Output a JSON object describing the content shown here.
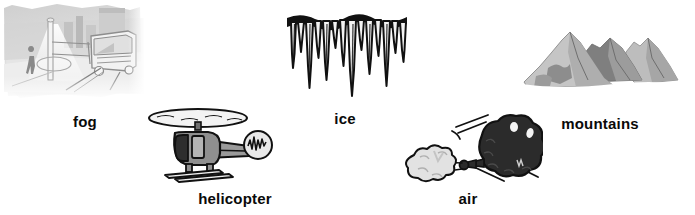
{
  "page": {
    "background_color": "#ffffff",
    "text_color": "#0a0a0a",
    "width": 695,
    "height": 215
  },
  "palette": {
    "ink": "#111111",
    "dark_gray": "#4a4a4a",
    "mid_gray": "#808080",
    "light_gray": "#b8b8b8",
    "pale_gray": "#dcdcdc",
    "near_white": "#f0f0f0",
    "balloon_black": "#2b2b2b"
  },
  "items": [
    {
      "id": "fog",
      "label": "fog",
      "icon": "fog-street-scene-icon",
      "description": "grayscale sketch of a foggy street with a bus, a pedestrian, a lamp post and city buildings",
      "x": 2,
      "y": 2,
      "width": 143,
      "height": 100,
      "label_x": 85,
      "label_y": 113
    },
    {
      "id": "helicopter",
      "label": "helicopter",
      "icon": "helicopter-icon",
      "description": "gray cartoon helicopter with spinning rotor, skids and a noise burst at the tail rotor",
      "x": 145,
      "y": 100,
      "width": 130,
      "height": 85,
      "label_x": 235,
      "label_y": 190
    },
    {
      "id": "ice",
      "label": "ice",
      "icon": "icicles-icon",
      "description": "row of black outlined icicles hanging from a ledge",
      "x": 283,
      "y": 8,
      "width": 128,
      "height": 92,
      "label_x": 345,
      "label_y": 110
    },
    {
      "id": "air",
      "label": "air",
      "icon": "air-balloon-blowing-icon",
      "description": "dark lumpy balloon deflating and blowing a pale puff of air through a nozzle",
      "x": 378,
      "y": 105,
      "width": 165,
      "height": 85,
      "label_x": 468,
      "label_y": 190
    },
    {
      "id": "mountains",
      "label": "mountains",
      "icon": "mountains-icon",
      "description": "three gray mountain peaks with shaded slopes",
      "x": 518,
      "y": 18,
      "width": 165,
      "height": 85,
      "label_x": 600,
      "label_y": 115
    }
  ]
}
